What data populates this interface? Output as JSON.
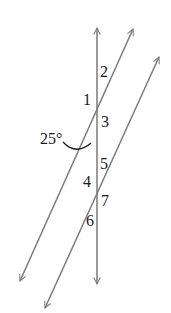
{
  "diagram": {
    "colors": {
      "line": "#7a7a7a",
      "text": "#1a1a1a",
      "background": "#ffffff"
    },
    "lines": [
      {
        "name": "transversal-vertical",
        "x1": 97,
        "y1": 28,
        "x2": 97,
        "y2": 284,
        "arrows": "both"
      },
      {
        "name": "parallel-line-1",
        "x1": 133,
        "y1": 29,
        "x2": 20,
        "y2": 281,
        "arrows": "both"
      },
      {
        "name": "parallel-line-2",
        "x1": 159,
        "y1": 57,
        "x2": 45,
        "y2": 308,
        "arrows": "both"
      }
    ],
    "angle_labels": [
      {
        "id": "2",
        "text": "2"
      },
      {
        "id": "1",
        "text": "1"
      },
      {
        "id": "3",
        "text": "3"
      },
      {
        "id": "25deg",
        "text": "25°"
      },
      {
        "id": "5",
        "text": "5"
      },
      {
        "id": "4",
        "text": "4"
      },
      {
        "id": "7",
        "text": "7"
      },
      {
        "id": "6",
        "text": "6"
      }
    ],
    "given_angle": {
      "value": "25°",
      "marked_with": "arc"
    }
  }
}
